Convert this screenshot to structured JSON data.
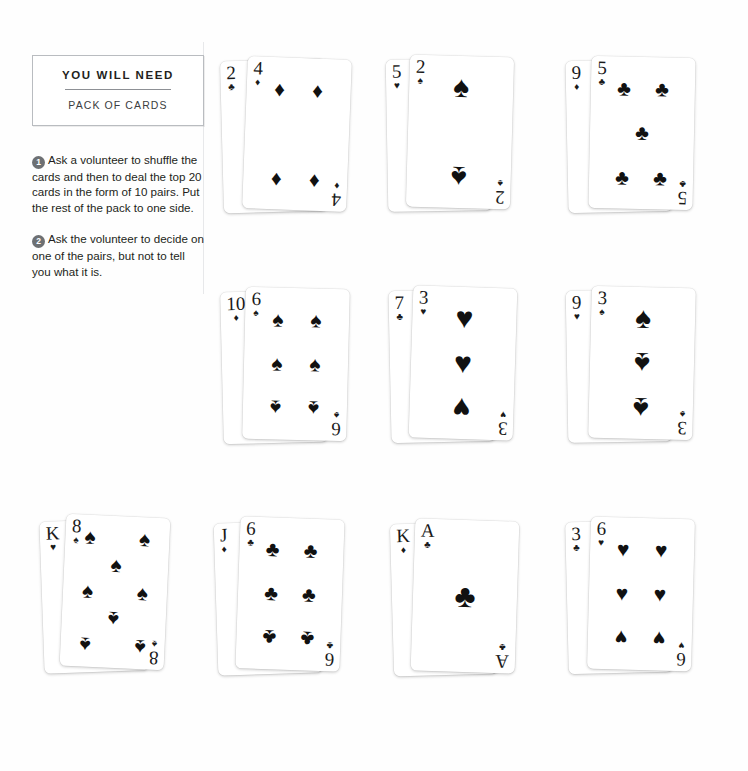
{
  "sidebar": {
    "need_box": {
      "title": "YOU WILL NEED",
      "item": "PACK OF CARDS"
    },
    "steps": [
      {
        "number": "1",
        "text": "Ask a volunteer to shuffle the cards and then to deal the top 20 cards in the form of 10 pairs. Put the rest of the pack to one side."
      },
      {
        "number": "2",
        "text": "Ask the volunteer to decide on one of the pairs, but not to tell you what it is."
      }
    ]
  },
  "suits": {
    "spade": "♠",
    "heart": "♥",
    "club": "♣",
    "diamond": "♦"
  },
  "pairs": [
    {
      "id": "pair-1",
      "back": {
        "rank": "2",
        "suit_name": "club",
        "suit": "♣"
      },
      "front": {
        "rank": "4",
        "suit_name": "diamond",
        "suit": "♦",
        "pip_count": 4
      }
    },
    {
      "id": "pair-2",
      "back": {
        "rank": "5",
        "suit_name": "heart",
        "suit": "♥"
      },
      "front": {
        "rank": "2",
        "suit_name": "spade",
        "suit": "♠",
        "pip_count": 2
      }
    },
    {
      "id": "pair-3",
      "back": {
        "rank": "9",
        "suit_name": "diamond",
        "suit": "♦"
      },
      "front": {
        "rank": "5",
        "suit_name": "club",
        "suit": "♣",
        "pip_count": 5
      }
    },
    {
      "id": "pair-4",
      "back": {
        "rank": "10",
        "suit_name": "diamond",
        "suit": "♦"
      },
      "front": {
        "rank": "6",
        "suit_name": "spade",
        "suit": "♠",
        "pip_count": 6
      }
    },
    {
      "id": "pair-5",
      "back": {
        "rank": "7",
        "suit_name": "club",
        "suit": "♣"
      },
      "front": {
        "rank": "3",
        "suit_name": "heart",
        "suit": "♥",
        "pip_count": 3
      }
    },
    {
      "id": "pair-6",
      "back": {
        "rank": "9",
        "suit_name": "heart",
        "suit": "♥"
      },
      "front": {
        "rank": "3",
        "suit_name": "spade",
        "suit": "♠",
        "pip_count": 3
      }
    },
    {
      "id": "pair-7",
      "back": {
        "rank": "K",
        "suit_name": "heart",
        "suit": "♥"
      },
      "front": {
        "rank": "8",
        "suit_name": "spade",
        "suit": "♠",
        "pip_count": 8
      }
    },
    {
      "id": "pair-8",
      "back": {
        "rank": "J",
        "suit_name": "diamond",
        "suit": "♦"
      },
      "front": {
        "rank": "6",
        "suit_name": "club",
        "suit": "♣",
        "pip_count": 6
      }
    },
    {
      "id": "pair-9",
      "back": {
        "rank": "K",
        "suit_name": "diamond",
        "suit": "♦"
      },
      "front": {
        "rank": "A",
        "suit_name": "club",
        "suit": "♣",
        "pip_count": 1
      }
    },
    {
      "id": "pair-10",
      "back": {
        "rank": "3",
        "suit_name": "club",
        "suit": "♣"
      },
      "front": {
        "rank": "6",
        "suit_name": "heart",
        "suit": "♥",
        "pip_count": 6
      }
    }
  ],
  "colors": {
    "ink": "#231f20",
    "badge": "#6d7073",
    "rule": "#8d9095",
    "box_border": "#b9bcc0",
    "divider": "#e7e8ea",
    "page": "#fefefe"
  }
}
